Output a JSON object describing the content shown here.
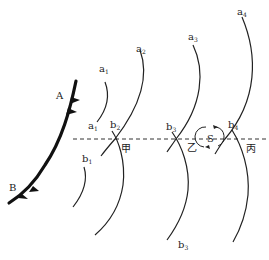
{
  "diagram": {
    "front": {
      "start_label": "A",
      "end_label": "B"
    },
    "isobar_labels": {
      "a1_top": {
        "base": "a",
        "sub": "1"
      },
      "a1_low": {
        "base": "a",
        "sub": "1"
      },
      "a2": {
        "base": "a",
        "sub": "2"
      },
      "a3": {
        "base": "a",
        "sub": "3"
      },
      "a4": {
        "base": "a",
        "sub": "4"
      },
      "b1": {
        "base": "b",
        "sub": "1"
      },
      "b2": {
        "base": "b",
        "sub": "2"
      },
      "b3_top": {
        "base": "b",
        "sub": "3"
      },
      "b3_bottom": {
        "base": "b",
        "sub": "3"
      },
      "b4": {
        "base": "b",
        "sub": "4"
      }
    },
    "points": {
      "jia": "甲",
      "yi": "乙",
      "bing": "丙"
    },
    "center": {
      "label": "S"
    },
    "colors": {
      "line": "#1a1a1a",
      "background": "#ffffff"
    }
  }
}
